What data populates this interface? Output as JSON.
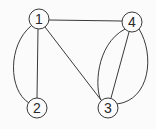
{
  "diagram": {
    "type": "undirected-multigraph",
    "colors": {
      "background": "#fbfbfb",
      "stroke": "#3a3a3a",
      "text": "#2a2a2a"
    },
    "nodes": [
      {
        "id": "1",
        "label": "1"
      },
      {
        "id": "2",
        "label": "2"
      },
      {
        "id": "3",
        "label": "3"
      },
      {
        "id": "4",
        "label": "4"
      }
    ],
    "edges": [
      {
        "from": "1",
        "to": "4",
        "shape": "straight"
      },
      {
        "from": "1",
        "to": "2",
        "shape": "straight"
      },
      {
        "from": "1",
        "to": "2",
        "shape": "curved-left"
      },
      {
        "from": "1",
        "to": "3",
        "shape": "straight"
      },
      {
        "from": "4",
        "to": "3",
        "shape": "straight"
      },
      {
        "from": "4",
        "to": "3",
        "shape": "curved-left"
      },
      {
        "from": "4",
        "to": "3",
        "shape": "curved-right"
      }
    ]
  }
}
